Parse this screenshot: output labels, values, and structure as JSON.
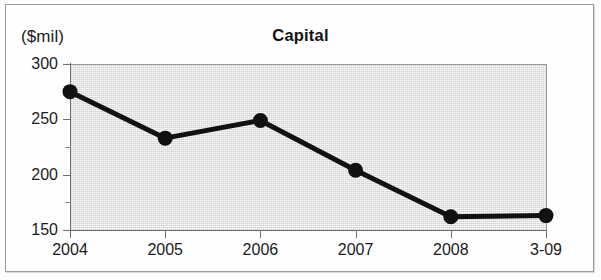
{
  "chart_data": {
    "type": "line",
    "title": "Capital",
    "unit_label": "($mil)",
    "xlabel": "",
    "ylabel": "($mil)",
    "categories": [
      "2004",
      "2005",
      "2006",
      "2007",
      "2008",
      "3-09"
    ],
    "values": [
      275,
      233,
      249,
      204,
      162,
      163
    ],
    "series": [
      {
        "name": "Capital",
        "values": [
          275,
          233,
          249,
          204,
          162,
          163
        ]
      }
    ],
    "ylim": [
      150,
      300
    ],
    "yticks": [
      150,
      200,
      250,
      300
    ],
    "ytick_labels": [
      "150",
      "200",
      "250",
      "300"
    ],
    "yticks_minor": [
      175,
      225,
      275
    ],
    "grid": false,
    "legend": "none",
    "marker": "filled-circle",
    "line_color": "#111111",
    "marker_color": "#111111",
    "plot_background": "#e3e3e3",
    "axis_color": "#6e6e6e",
    "text_color": "#1b1b1b"
  },
  "frame": {
    "border_color": "#9a9a9a"
  }
}
